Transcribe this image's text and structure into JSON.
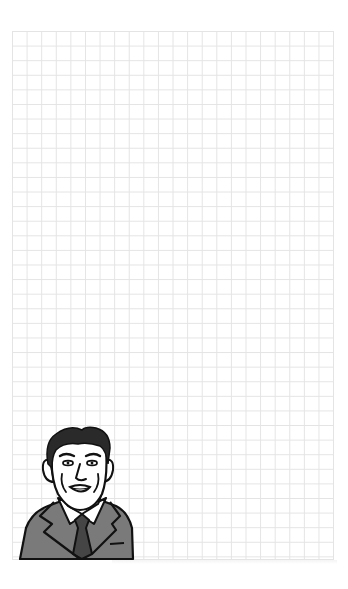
{
  "sheet": {
    "type": "grid-paper",
    "grid_columns": 22,
    "grid_rows": 36,
    "grid_line_color": "#e4e4e4",
    "background_color": "#ffffff"
  },
  "illustration": {
    "subject": "man-in-suit-portrait",
    "position": "bottom-left",
    "colors": {
      "hair": "#2a2a2a",
      "skin": "#ffffff",
      "suit": "#7a7a7a",
      "tie": "#454545",
      "shirt": "#ffffff",
      "outline": "#111111"
    }
  }
}
